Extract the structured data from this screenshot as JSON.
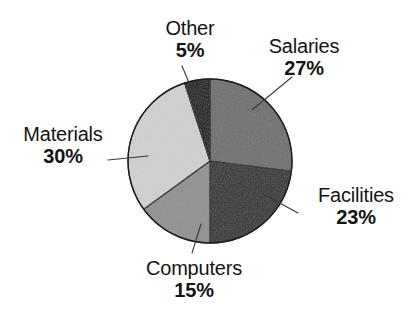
{
  "chart_data": {
    "type": "pie",
    "title": "",
    "subtitle": "",
    "xlabel": "",
    "ylabel": "",
    "legend": "none",
    "grid": false,
    "value_unit": "%",
    "start_angle_deg": 0,
    "direction": "clockwise",
    "categories": [
      "Salaries",
      "Facilities",
      "Computers",
      "Materials",
      "Other"
    ],
    "values": [
      27,
      23,
      15,
      30,
      5
    ],
    "slices": [
      {
        "label": "Salaries",
        "value": 27,
        "value_text": "27%",
        "color": "#6e6e6e",
        "start_deg": 0,
        "end_deg": 97.2,
        "leader_line": true
      },
      {
        "label": "Facilities",
        "value": 23,
        "value_text": "23%",
        "color": "#303030",
        "start_deg": 97.2,
        "end_deg": 180.0,
        "leader_line": true
      },
      {
        "label": "Computers",
        "value": 15,
        "value_text": "15%",
        "color": "#909090",
        "start_deg": 180.0,
        "end_deg": 234.0,
        "leader_line": true
      },
      {
        "label": "Materials",
        "value": 30,
        "value_text": "30%",
        "color": "#d0d0d0",
        "start_deg": 234.0,
        "end_deg": 342.0,
        "leader_line": true
      },
      {
        "label": "Other",
        "value": 5,
        "value_text": "5%",
        "color": "#0a0a0a",
        "start_deg": 342.0,
        "end_deg": 360.0,
        "leader_line": true
      }
    ]
  },
  "labels": {
    "salaries": {
      "name": "Salaries",
      "pct": "27%"
    },
    "facilities": {
      "name": "Facilities",
      "pct": "23%"
    },
    "computers": {
      "name": "Computers",
      "pct": "15%"
    },
    "materials": {
      "name": "Materials",
      "pct": "30%"
    },
    "other": {
      "name": "Other",
      "pct": "5%"
    }
  },
  "style": {
    "background": "#ffffff",
    "text_color": "#141414",
    "outline_color": "#1d1d1d",
    "leader_color": "#3a3a3a"
  }
}
